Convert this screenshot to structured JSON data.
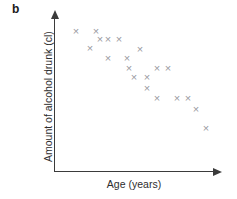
{
  "panel": {
    "label": "b"
  },
  "axes": {
    "x_title": "Age (years)",
    "y_title": "Amount of alcohol drunk (cl)",
    "axis_color": "#3b3b3b",
    "marker_color": "#9a9a9f"
  },
  "chart_data": {
    "type": "scatter",
    "title": "b",
    "xlabel": "Age (years)",
    "ylabel": "Amount of alcohol drunk (cl)",
    "xlim": [
      0,
      100
    ],
    "ylim": [
      0,
      100
    ],
    "grid": false,
    "legend": null,
    "marker": "x",
    "marker_color": "#9a9a9f",
    "relationship": "negative correlation",
    "n_points": 20,
    "points": [
      {
        "x": 13.1,
        "y": 91.6
      },
      {
        "x": 25.0,
        "y": 91.6
      },
      {
        "x": 21.4,
        "y": 79.7
      },
      {
        "x": 32.1,
        "y": 85.3
      },
      {
        "x": 38.7,
        "y": 85.3
      },
      {
        "x": 32.1,
        "y": 73.4
      },
      {
        "x": 51.2,
        "y": 79.0
      },
      {
        "x": 43.5,
        "y": 73.4
      },
      {
        "x": 44.6,
        "y": 66.4
      },
      {
        "x": 55.4,
        "y": 60.1
      },
      {
        "x": 61.3,
        "y": 66.4
      },
      {
        "x": 67.9,
        "y": 66.4
      },
      {
        "x": 55.4,
        "y": 52.4
      },
      {
        "x": 61.3,
        "y": 45.5
      },
      {
        "x": 73.2,
        "y": 45.5
      },
      {
        "x": 79.8,
        "y": 45.5
      },
      {
        "x": 84.5,
        "y": 37.8
      },
      {
        "x": 90.5,
        "y": 24.5
      },
      {
        "x": 26.2,
        "y": 85.3
      },
      {
        "x": 47.0,
        "y": 60.1
      }
    ],
    "pixel_points": [
      {
        "px": 76,
        "py": 31
      },
      {
        "px": 96,
        "py": 31
      },
      {
        "px": 90,
        "py": 48
      },
      {
        "px": 108,
        "py": 39
      },
      {
        "px": 119,
        "py": 39
      },
      {
        "px": 108,
        "py": 58
      },
      {
        "px": 140,
        "py": 49
      },
      {
        "px": 127,
        "py": 58
      },
      {
        "px": 129,
        "py": 68
      },
      {
        "px": 147,
        "py": 77
      },
      {
        "px": 157,
        "py": 68
      },
      {
        "px": 168,
        "py": 68
      },
      {
        "px": 147,
        "py": 88
      },
      {
        "px": 157,
        "py": 98
      },
      {
        "px": 177,
        "py": 98
      },
      {
        "px": 188,
        "py": 98
      },
      {
        "px": 196,
        "py": 109
      },
      {
        "px": 206,
        "py": 128
      },
      {
        "px": 100,
        "py": 39
      },
      {
        "px": 134,
        "py": 77
      }
    ]
  }
}
